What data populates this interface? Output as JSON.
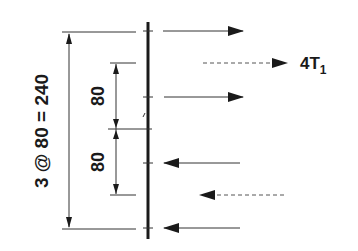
{
  "diagram": {
    "colors": {
      "ink": "#1a1a1a",
      "line": "#333333",
      "dash": "#555555",
      "background": "#ffffff"
    },
    "member": {
      "name": "vertical-member"
    },
    "forces": [
      {
        "direction": "right",
        "style": "solid",
        "y": 31
      },
      {
        "direction": "right",
        "style": "dashed",
        "y": 63,
        "label": "4T",
        "label_sub": "1"
      },
      {
        "direction": "right",
        "style": "solid",
        "y": 97
      },
      {
        "direction": "left",
        "style": "solid",
        "y": 163
      },
      {
        "direction": "left",
        "style": "dashed",
        "y": 195
      },
      {
        "direction": "left",
        "style": "solid",
        "y": 228
      }
    ],
    "dimensions": {
      "overall": {
        "label": "3 @ 80 = 240"
      },
      "upper": {
        "label": "80"
      },
      "lower": {
        "label": "80"
      }
    },
    "force_label": {
      "main": "4T",
      "sub": "1"
    }
  }
}
